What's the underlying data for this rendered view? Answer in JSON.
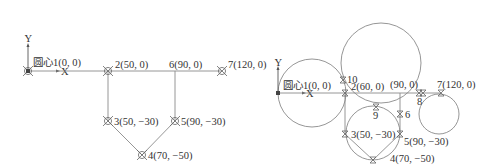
{
  "left_panel": {
    "axes": {
      "y_label": "Y",
      "x_label": "X"
    },
    "points": [
      {
        "id": "1",
        "label": "圆心1(0, 0)"
      },
      {
        "id": "2",
        "label": "2(50, 0)"
      },
      {
        "id": "6",
        "label": "6(90, 0)"
      },
      {
        "id": "7",
        "label": "7(120, 0)"
      },
      {
        "id": "3",
        "label": "3(50, −30)"
      },
      {
        "id": "5",
        "label": "5(90, −30)"
      },
      {
        "id": "4",
        "label": "4(70, −50)"
      }
    ]
  },
  "right_panel": {
    "axes": {
      "y_label": "Y",
      "x_label": "X"
    },
    "points": [
      {
        "id": "1",
        "label": "圆心1(0, 0)"
      },
      {
        "id": "10",
        "label": "10"
      },
      {
        "id": "2",
        "label": "2(60, 0)"
      },
      {
        "id": "90",
        "label": "(90, 0)"
      },
      {
        "id": "7",
        "label": "7(120, 0)"
      },
      {
        "id": "8",
        "label": "8"
      },
      {
        "id": "9",
        "label": "9"
      },
      {
        "id": "6",
        "label": "6"
      },
      {
        "id": "3",
        "label": "3(50, −30)"
      },
      {
        "id": "5",
        "label": "5(90, −30)"
      },
      {
        "id": "4",
        "label": "4(70, −50)"
      }
    ]
  },
  "colors": {
    "line": "#8a8a8a",
    "text": "#333333"
  }
}
